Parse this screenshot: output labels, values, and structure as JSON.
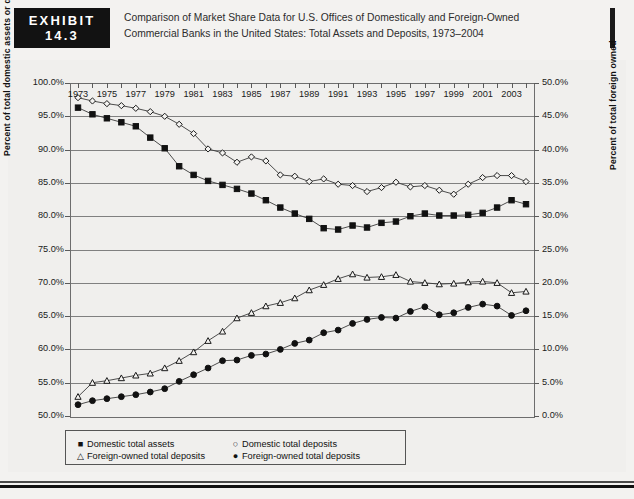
{
  "header": {
    "exhibit_word": "EXHIBIT",
    "exhibit_number": "14.3",
    "title_line1": "Comparison of Market Share Data for U.S. Offices of Domestically and Foreign-Owned",
    "title_line2": "Commercial Banks in the United States: Total Assets and Deposits, 1973–2004"
  },
  "footer": {
    "source_text": ""
  },
  "chart_data": {
    "type": "line",
    "title": "Comparison of Market Share Data for U.S. Offices of Domestically and Foreign-Owned Commercial Banks in the United States: Total Assets and Deposits, 1973–2004",
    "xlabel": "",
    "ylabel": "Percent of total domestic assets or deposits",
    "ylabel_right": "Percent of total foreign owned",
    "ylim": [
      50,
      100
    ],
    "ylim_right": [
      0,
      50
    ],
    "grid": true,
    "legend_position": "bottom-left",
    "x": [
      1973,
      1974,
      1975,
      1976,
      1977,
      1978,
      1979,
      1980,
      1981,
      1982,
      1983,
      1984,
      1985,
      1986,
      1987,
      1988,
      1989,
      1990,
      1991,
      1992,
      1993,
      1994,
      1995,
      1996,
      1997,
      1998,
      1999,
      2000,
      2001,
      2002,
      2003,
      2004
    ],
    "x_tick_labels": [
      "1973",
      "1975",
      "1977",
      "1979",
      "1981",
      "1983",
      "1985",
      "1987",
      "1989",
      "1991",
      "1993",
      "1995",
      "1997",
      "1999",
      "2001",
      "2003"
    ],
    "y_tick_labels_left": [
      "100.0%",
      "95.0%",
      "90.0%",
      "85.0%",
      "80.0%",
      "75.0%",
      "70.0%",
      "65.0%",
      "60.0%",
      "55.0%",
      "50.0%"
    ],
    "y_tick_labels_right": [
      "50.0%",
      "45.0%",
      "40.0%",
      "35.0%",
      "30.0%",
      "25.0%",
      "20.0%",
      "15.0%",
      "10.0%",
      "5.0%",
      "0.0%"
    ],
    "series": [
      {
        "name": "Domestic total assets",
        "marker": "filled-square",
        "axis": "left",
        "values": [
          96.3,
          95.3,
          94.7,
          94.1,
          93.5,
          91.8,
          90.2,
          87.5,
          86.2,
          85.3,
          84.7,
          84.1,
          83.4,
          82.4,
          81.3,
          80.4,
          79.6,
          78.2,
          78.0,
          78.6,
          78.3,
          79.0,
          79.2,
          80.0,
          80.4,
          80.1,
          80.1,
          80.2,
          80.5,
          81.3,
          82.4,
          81.8
        ]
      },
      {
        "name": "Domestic total deposits",
        "marker": "open-diamond",
        "axis": "left",
        "values": [
          97.8,
          97.3,
          96.9,
          96.6,
          96.2,
          95.7,
          95.0,
          93.8,
          92.4,
          90.1,
          89.5,
          88.1,
          88.9,
          88.3,
          86.2,
          86.0,
          85.2,
          85.6,
          84.8,
          84.6,
          83.7,
          84.3,
          85.1,
          84.4,
          84.6,
          83.9,
          83.3,
          84.8,
          85.8,
          86.1,
          86.1,
          85.2
        ]
      },
      {
        "name": "Foreign-owned total deposits",
        "marker": "open-triangle",
        "axis": "right",
        "values": [
          2.9,
          5.0,
          5.3,
          5.7,
          6.1,
          6.4,
          7.2,
          8.3,
          9.6,
          11.3,
          12.7,
          14.7,
          15.5,
          16.5,
          17.0,
          17.7,
          18.9,
          19.7,
          20.6,
          21.3,
          20.8,
          20.9,
          21.2,
          20.2,
          20.0,
          19.8,
          19.9,
          20.1,
          20.2,
          20.0,
          18.5,
          18.7
        ]
      },
      {
        "name": "Foreign-owned total deposits",
        "marker": "filled-circle",
        "axis": "right",
        "values": [
          1.7,
          2.3,
          2.6,
          2.9,
          3.2,
          3.6,
          4.1,
          5.2,
          6.2,
          7.2,
          8.3,
          8.4,
          9.1,
          9.3,
          10.0,
          10.9,
          11.4,
          12.5,
          12.9,
          13.9,
          14.5,
          14.8,
          14.7,
          15.7,
          16.4,
          15.2,
          15.5,
          16.3,
          16.8,
          16.5,
          15.1,
          15.8
        ]
      }
    ],
    "legend": [
      {
        "label": "Domestic total assets",
        "symbol": "■"
      },
      {
        "label": "Domestic total deposits",
        "symbol": "○"
      },
      {
        "label": "Foreign-owned total deposits",
        "symbol": "△"
      },
      {
        "label": "Foreign-owned total deposits",
        "symbol": "●"
      }
    ]
  }
}
